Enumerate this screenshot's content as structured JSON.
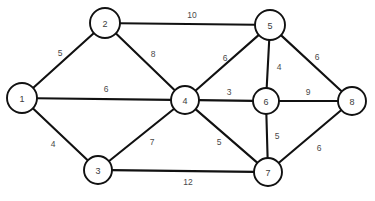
{
  "figure": {
    "background_color": "#ffffff",
    "node_fill_color": "#ffffff",
    "node_stroke_color": "#111111",
    "edge_color": "#111111",
    "label_color": "#4a4a4a"
  },
  "chart_data": {
    "type": "diagram",
    "title": "",
    "xlabel": "",
    "ylabel": "",
    "grid": false,
    "legend": "none",
    "graph_kind": "weighted-undirected-graph",
    "nodes": [
      {
        "id": "1",
        "label": "1",
        "x": 22,
        "y": 98,
        "r": 15
      },
      {
        "id": "2",
        "label": "2",
        "x": 105,
        "y": 23,
        "r": 15
      },
      {
        "id": "3",
        "label": "3",
        "x": 98,
        "y": 170,
        "r": 14
      },
      {
        "id": "4",
        "label": "4",
        "x": 185,
        "y": 100,
        "r": 14
      },
      {
        "id": "5",
        "label": "5",
        "x": 270,
        "y": 25,
        "r": 15
      },
      {
        "id": "6",
        "label": "6",
        "x": 266,
        "y": 101,
        "r": 13
      },
      {
        "id": "7",
        "label": "7",
        "x": 268,
        "y": 172,
        "r": 14
      },
      {
        "id": "8",
        "label": "8",
        "x": 352,
        "y": 101,
        "r": 14
      }
    ],
    "edges": [
      {
        "source": "1",
        "target": "2",
        "weight": "5",
        "label_x": 60,
        "label_y": 53
      },
      {
        "source": "1",
        "target": "4",
        "weight": "6",
        "label_x": 106,
        "label_y": 89
      },
      {
        "source": "1",
        "target": "3",
        "weight": "4",
        "label_x": 53,
        "label_y": 144
      },
      {
        "source": "2",
        "target": "5",
        "weight": "10",
        "label_x": 192,
        "label_y": 15
      },
      {
        "source": "2",
        "target": "4",
        "weight": "8",
        "label_x": 153,
        "label_y": 54
      },
      {
        "source": "3",
        "target": "4",
        "weight": "7",
        "label_x": 152,
        "label_y": 142
      },
      {
        "source": "3",
        "target": "7",
        "weight": "12",
        "label_x": 188,
        "label_y": 182
      },
      {
        "source": "4",
        "target": "5",
        "weight": "6",
        "label_x": 225,
        "label_y": 58
      },
      {
        "source": "4",
        "target": "6",
        "weight": "3",
        "label_x": 229,
        "label_y": 92
      },
      {
        "source": "4",
        "target": "7",
        "weight": "5",
        "label_x": 219,
        "label_y": 142
      },
      {
        "source": "5",
        "target": "6",
        "weight": "4",
        "label_x": 279,
        "label_y": 67
      },
      {
        "source": "5",
        "target": "8",
        "weight": "6",
        "label_x": 317,
        "label_y": 57
      },
      {
        "source": "6",
        "target": "7",
        "weight": "5",
        "label_x": 277,
        "label_y": 136
      },
      {
        "source": "6",
        "target": "8",
        "weight": "9",
        "label_x": 308,
        "label_y": 92
      },
      {
        "source": "7",
        "target": "8",
        "weight": "6",
        "label_x": 319,
        "label_y": 148
      }
    ]
  }
}
